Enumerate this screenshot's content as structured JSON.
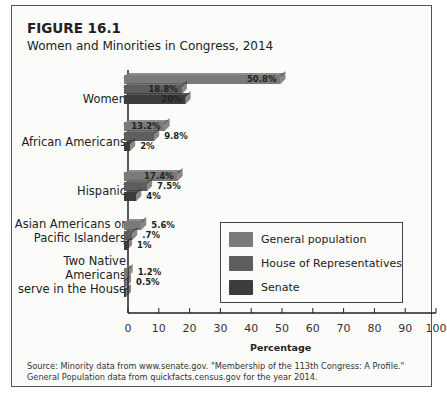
{
  "figure": {
    "number": "FIGURE 16.1",
    "title": "Women and Minorities in Congress, 2014",
    "source_line1": "Source: Minority data from www.senate.gov. \"Membership of the 113th Congress: A Profile.\"",
    "source_line2": "General Population data from quickfacts.census.gov for the year 2014."
  },
  "chart_data": {
    "type": "bar",
    "orientation": "horizontal",
    "title": "Women and Minorities in Congress, 2014",
    "xlabel": "Percentage",
    "ylabel": "",
    "xlim": [
      0,
      100
    ],
    "x_ticks": [
      "0",
      "10",
      "20",
      "30",
      "40",
      "50",
      "60",
      "70",
      "80",
      "90",
      "100"
    ],
    "categories": [
      "Women",
      "African Americans",
      "Hispanic",
      "Asian Americans or Pacific Islanders",
      "Two Native Americans serve in the House"
    ],
    "category_labels": [
      [
        "Women"
      ],
      [
        "African Americans"
      ],
      [
        "Hispanic"
      ],
      [
        "Asian Americans or",
        "Pacific Islanders"
      ],
      [
        "Two Native",
        "Americans",
        "serve in the House"
      ]
    ],
    "series": [
      {
        "name": "General population",
        "color": "#7a7a7a",
        "values": [
          50.8,
          13.2,
          17.4,
          5.6,
          1.2
        ],
        "labels": [
          "50.8%",
          "13.2%",
          "17.4%",
          "5.6%",
          "1.2%"
        ]
      },
      {
        "name": "House of Representatives",
        "color": "#5e5e5e",
        "values": [
          18.8,
          9.8,
          7.5,
          2.7,
          0.5
        ],
        "labels": [
          "18.8%",
          "9.8%",
          "7.5%",
          ".7%",
          "0.5%"
        ]
      },
      {
        "name": "Senate",
        "color": "#3c3c3c",
        "values": [
          20,
          2,
          4,
          1,
          0
        ],
        "labels": [
          "20%",
          "2%",
          "4%",
          "1%",
          ""
        ]
      }
    ],
    "legend_position": "inside-lower-right",
    "grid": false
  }
}
